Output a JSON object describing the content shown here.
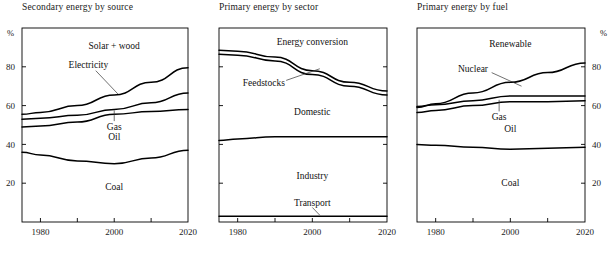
{
  "figure": {
    "width": 613,
    "height": 257,
    "background": "#ffffff",
    "line_color": "#000000",
    "axis_color": "#000000"
  },
  "chart_data": [
    {
      "type": "area",
      "title": "Secondary energy by source",
      "xlabel": "",
      "ylabel": "%",
      "x": [
        1975,
        1980,
        1990,
        2000,
        2010,
        2020
      ],
      "xlim": [
        1975,
        2020
      ],
      "ylim": [
        0,
        100
      ],
      "xticks": [
        1980,
        1990,
        2000,
        2010,
        2020
      ],
      "xtick_labels": [
        "1980",
        "",
        "2000",
        "",
        "2020"
      ],
      "yticks": [
        20,
        40,
        60,
        80
      ],
      "ytick_labels": [
        "20",
        "40",
        "60",
        "80"
      ],
      "y_axis_side": "left",
      "grid": false,
      "legend": "inline-band-labels",
      "boundaries": [
        {
          "name": "Coal",
          "values": [
            36,
            34.5,
            31.5,
            30,
            33,
            37
          ]
        },
        {
          "name": "Oil",
          "values": [
            49,
            49.5,
            51.5,
            55.5,
            57,
            58
          ]
        },
        {
          "name": "Gas",
          "values": [
            53,
            53.5,
            55,
            58,
            61.5,
            66.5
          ]
        },
        {
          "name": "Electricity",
          "values": [
            55.5,
            56.5,
            60,
            65.5,
            72,
            79.5
          ]
        }
      ],
      "bands": [
        {
          "label": "Coal",
          "label_x": 2000,
          "label_y": 18,
          "leader": false
        },
        {
          "label": "Oil",
          "label_x": 2000,
          "label_y": 44,
          "leader": false
        },
        {
          "label": "Gas",
          "label_x": 2000,
          "label_y": 49,
          "leader": true,
          "leader_from": [
            2000,
            52
          ],
          "leader_to": [
            2000,
            57.5
          ]
        },
        {
          "label": "Electricity",
          "label_x": 1993,
          "label_y": 81,
          "leader": true,
          "leader_from": [
            1995,
            78
          ],
          "leader_to": [
            2001,
            66
          ]
        },
        {
          "label": "Solar + wood",
          "label_x": 2000,
          "label_y": 91,
          "leader": false
        }
      ]
    },
    {
      "type": "area",
      "title": "Primary energy by sector",
      "xlabel": "",
      "ylabel": "",
      "x": [
        1975,
        1980,
        1990,
        2000,
        2010,
        2020
      ],
      "xlim": [
        1975,
        2020
      ],
      "ylim": [
        0,
        100
      ],
      "xticks": [
        1980,
        1990,
        2000,
        2010,
        2020
      ],
      "xtick_labels": [
        "1980",
        "",
        "2000",
        "",
        "2020"
      ],
      "yticks": [
        20,
        40,
        60,
        80
      ],
      "ytick_labels": [
        "",
        "",
        "",
        ""
      ],
      "y_axis_side": "none",
      "grid": false,
      "legend": "inline-band-labels",
      "boundaries": [
        {
          "name": "Transport",
          "values": [
            3,
            3,
            3,
            3,
            3,
            3
          ]
        },
        {
          "name": "Industry",
          "values": [
            42,
            42.8,
            44,
            44,
            44,
            44
          ]
        },
        {
          "name": "Domestic",
          "values": [
            86.5,
            86,
            83,
            76,
            70,
            65.5
          ]
        },
        {
          "name": "Feedstocks",
          "values": [
            88.5,
            88,
            85,
            78,
            72,
            67.5
          ]
        }
      ],
      "bands": [
        {
          "label": "Transport",
          "label_x": 2000,
          "label_y": 10,
          "leader": true,
          "leader_from": [
            2000,
            7.5
          ],
          "leader_to": [
            2002,
            3.5
          ]
        },
        {
          "label": "Industry",
          "label_x": 2000,
          "label_y": 24,
          "leader": false
        },
        {
          "label": "Domestic",
          "label_x": 2000,
          "label_y": 57,
          "leader": false
        },
        {
          "label": "Feedstocks",
          "label_x": 1987,
          "label_y": 72,
          "leader": true,
          "leader_from": [
            1993,
            73
          ],
          "leader_to": [
            2002,
            79
          ]
        },
        {
          "label": "Energy conversion",
          "label_x": 2000,
          "label_y": 93,
          "leader": false
        }
      ]
    },
    {
      "type": "area",
      "title": "Primary energy by fuel",
      "xlabel": "",
      "ylabel": "%",
      "x": [
        1975,
        1980,
        1990,
        2000,
        2010,
        2020
      ],
      "xlim": [
        1975,
        2020
      ],
      "ylim": [
        0,
        100
      ],
      "xticks": [
        1980,
        1990,
        2000,
        2010,
        2020
      ],
      "xtick_labels": [
        "1980",
        "",
        "2000",
        "",
        "2020"
      ],
      "yticks": [
        20,
        40,
        60,
        80
      ],
      "ytick_labels": [
        "20",
        "40",
        "60",
        "80"
      ],
      "y_axis_side": "right",
      "grid": false,
      "legend": "inline-band-labels",
      "boundaries": [
        {
          "name": "Coal",
          "values": [
            40,
            39.5,
            38.5,
            37.5,
            38,
            38.5
          ]
        },
        {
          "name": "Oil",
          "values": [
            56.5,
            57.5,
            60,
            62,
            62,
            62.5
          ]
        },
        {
          "name": "Gas",
          "values": [
            59.5,
            60.5,
            62.5,
            65,
            65,
            65
          ]
        },
        {
          "name": "Nuclear",
          "values": [
            59,
            61,
            66.5,
            72,
            77,
            82
          ]
        }
      ],
      "bands": [
        {
          "label": "Coal",
          "label_x": 2000,
          "label_y": 20,
          "leader": false
        },
        {
          "label": "Oil",
          "label_x": 2000,
          "label_y": 48,
          "leader": false
        },
        {
          "label": "Gas",
          "label_x": 1997,
          "label_y": 54,
          "leader": true,
          "leader_from": [
            1997,
            57
          ],
          "leader_to": [
            1997,
            63
          ]
        },
        {
          "label": "Nuclear",
          "label_x": 1990,
          "label_y": 79,
          "leader": true,
          "leader_from": [
            1995,
            77
          ],
          "leader_to": [
            2003,
            70
          ]
        },
        {
          "label": "Renewable",
          "label_x": 2000,
          "label_y": 92,
          "leader": false
        }
      ]
    }
  ]
}
